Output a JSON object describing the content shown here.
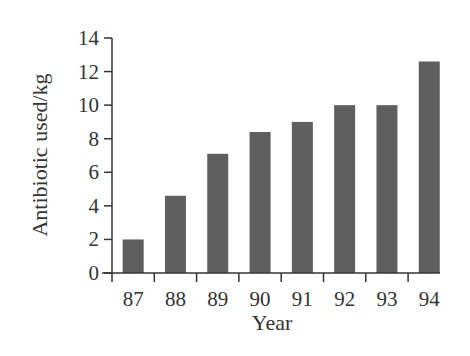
{
  "chart_data": {
    "type": "bar",
    "title": "",
    "xlabel": "Year",
    "ylabel": "Antibiotic used/kg",
    "categories": [
      "87",
      "88",
      "89",
      "90",
      "91",
      "92",
      "93",
      "94"
    ],
    "values": [
      2.0,
      4.6,
      7.1,
      8.4,
      9.0,
      10.0,
      10.0,
      12.6
    ],
    "ylim": [
      0,
      14
    ],
    "yticks": [
      0,
      2,
      4,
      6,
      8,
      10,
      12,
      14
    ],
    "grid": false,
    "legend": null,
    "bar_color": "#5f5f5f",
    "axis_color": "#333333"
  }
}
